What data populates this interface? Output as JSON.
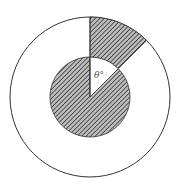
{
  "diagram": {
    "type": "concentric-circles-with-shaded-sectors",
    "angle_label": "θ°",
    "theta_degrees_estimated": 45,
    "radius_ratio_outer_to_inner": 2,
    "colors": {
      "stroke": "#333333",
      "hatch_line": "#3a3a3a",
      "hatch_background": "#bdbdbd",
      "background": "#ffffff",
      "label": "#555555"
    }
  }
}
